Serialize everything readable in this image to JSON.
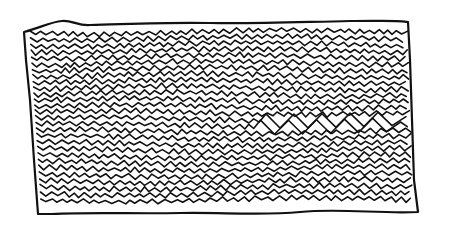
{
  "figure": {
    "stroke_color": "#111111",
    "background_color": "#ffffff",
    "frame": {
      "left": 24,
      "top": 22,
      "right": 410,
      "bottom": 212
    },
    "line_count": 28
  }
}
